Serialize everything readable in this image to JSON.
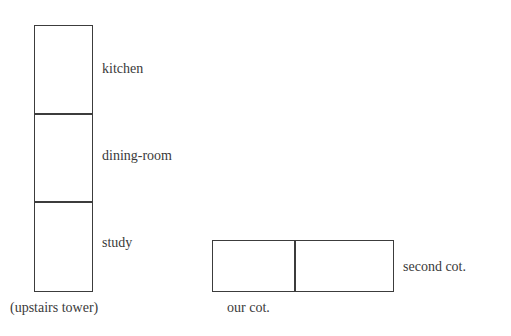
{
  "tower": {
    "caption": "(upstairs tower)",
    "rooms": [
      "kitchen",
      "dining-room",
      "study"
    ]
  },
  "cots": {
    "left_label": "our cot.",
    "right_label": "second cot."
  }
}
